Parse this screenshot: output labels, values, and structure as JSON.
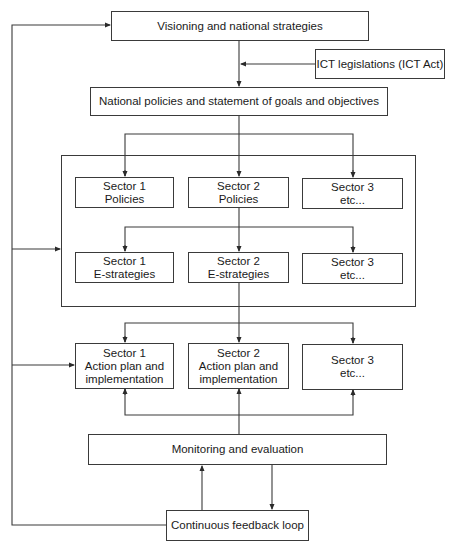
{
  "diagram": {
    "top": {
      "label": "Visioning and national strategies"
    },
    "ict": {
      "label": "ICT legislations (ICT Act)"
    },
    "national": {
      "label": "National policies and statement of goals and objectives"
    },
    "policies": [
      {
        "line1": "Sector 1",
        "line2": "Policies"
      },
      {
        "line1": "Sector 2",
        "line2": "Policies"
      },
      {
        "line1": "Sector 3",
        "line2": "etc..."
      }
    ],
    "estrategies": [
      {
        "line1": "Sector 1",
        "line2": "E-strategies"
      },
      {
        "line1": "Sector 2",
        "line2": "E-strategies"
      },
      {
        "line1": "Sector 3",
        "line2": "etc..."
      }
    ],
    "actions": [
      {
        "line1": "Sector 1",
        "line2": "Action plan and",
        "line3": "implementation"
      },
      {
        "line1": "Sector 2",
        "line2": "Action plan and",
        "line3": "implementation"
      },
      {
        "line1": "Sector 3",
        "line2": "etc...",
        "line3": ""
      }
    ],
    "monitoring": {
      "label": "Monitoring and evaluation"
    },
    "feedback": {
      "label": "Continuous feedback loop"
    }
  },
  "colors": {
    "line": "#3a3a3a",
    "background": "#ffffff"
  }
}
